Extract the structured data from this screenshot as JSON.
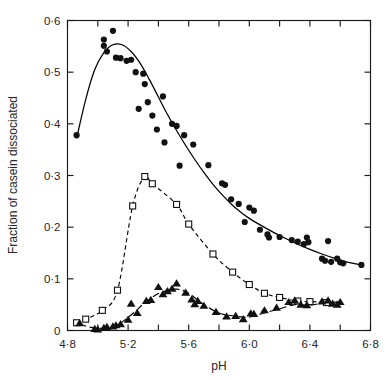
{
  "chart_data": {
    "type": "scatter",
    "title": "",
    "xlabel": "pH",
    "ylabel": "Fraction of casein dissociated",
    "xlim": [
      4.8,
      6.8
    ],
    "ylim": [
      0,
      0.6
    ],
    "grid": false,
    "legend_position": "none",
    "x_ticks": [
      4.8,
      5.2,
      5.6,
      6.0,
      6.4,
      6.8
    ],
    "x_tick_labels": [
      "4·8",
      "5·2",
      "5·6",
      "6·0",
      "6·4",
      "6·8"
    ],
    "x_minor_ticks": [
      5.0,
      5.4,
      5.8,
      6.2,
      6.6
    ],
    "y_ticks": [
      0,
      0.1,
      0.2,
      0.3,
      0.4,
      0.5,
      0.6
    ],
    "y_tick_labels": [
      "0",
      "0·1",
      "0·2",
      "0·3",
      "0·4",
      "0·5",
      "0·6"
    ],
    "series": [
      {
        "name": "total-casein",
        "marker": "filled-circle",
        "line_style": "solid",
        "points": [
          [
            4.86,
            0.378
          ],
          [
            5.04,
            0.563
          ],
          [
            5.04,
            0.551
          ],
          [
            5.06,
            0.54
          ],
          [
            5.1,
            0.58
          ],
          [
            5.12,
            0.528
          ],
          [
            5.15,
            0.527
          ],
          [
            5.19,
            0.522
          ],
          [
            5.22,
            0.524
          ],
          [
            5.25,
            0.5
          ],
          [
            5.27,
            0.429
          ],
          [
            5.3,
            0.497
          ],
          [
            5.31,
            0.477
          ],
          [
            5.33,
            0.442
          ],
          [
            5.36,
            0.416
          ],
          [
            5.39,
            0.389
          ],
          [
            5.43,
            0.453
          ],
          [
            5.44,
            0.364
          ],
          [
            5.49,
            0.4
          ],
          [
            5.52,
            0.396
          ],
          [
            5.54,
            0.319
          ],
          [
            5.57,
            0.378
          ],
          [
            5.63,
            0.36
          ],
          [
            5.73,
            0.32
          ],
          [
            5.82,
            0.285
          ],
          [
            5.84,
            0.282
          ],
          [
            5.88,
            0.254
          ],
          [
            5.93,
            0.245
          ],
          [
            5.97,
            0.21
          ],
          [
            6.0,
            0.238
          ],
          [
            6.03,
            0.232
          ],
          [
            6.07,
            0.195
          ],
          [
            6.12,
            0.186
          ],
          [
            6.13,
            0.18
          ],
          [
            6.2,
            0.181
          ],
          [
            6.28,
            0.175
          ],
          [
            6.32,
            0.172
          ],
          [
            6.36,
            0.167
          ],
          [
            6.38,
            0.18
          ],
          [
            6.39,
            0.171
          ],
          [
            6.48,
            0.139
          ],
          [
            6.5,
            0.135
          ],
          [
            6.52,
            0.173
          ],
          [
            6.54,
            0.133
          ],
          [
            6.58,
            0.139
          ],
          [
            6.6,
            0.132
          ],
          [
            6.62,
            0.13
          ],
          [
            6.74,
            0.127
          ]
        ],
        "fit_curve": [
          [
            4.86,
            0.372
          ],
          [
            4.92,
            0.447
          ],
          [
            4.98,
            0.505
          ],
          [
            5.04,
            0.538
          ],
          [
            5.1,
            0.553
          ],
          [
            5.16,
            0.553
          ],
          [
            5.22,
            0.54
          ],
          [
            5.28,
            0.517
          ],
          [
            5.34,
            0.486
          ],
          [
            5.4,
            0.452
          ],
          [
            5.46,
            0.418
          ],
          [
            5.52,
            0.387
          ],
          [
            5.58,
            0.358
          ],
          [
            5.64,
            0.331
          ],
          [
            5.7,
            0.306
          ],
          [
            5.76,
            0.283
          ],
          [
            5.82,
            0.263
          ],
          [
            5.88,
            0.245
          ],
          [
            5.94,
            0.23
          ],
          [
            6.0,
            0.217
          ],
          [
            6.08,
            0.203
          ],
          [
            6.16,
            0.19
          ],
          [
            6.24,
            0.178
          ],
          [
            6.32,
            0.167
          ],
          [
            6.4,
            0.157
          ],
          [
            6.48,
            0.148
          ],
          [
            6.56,
            0.14
          ],
          [
            6.64,
            0.133
          ],
          [
            6.74,
            0.127
          ]
        ]
      },
      {
        "name": "beta-casein",
        "marker": "open-square",
        "line_style": "dashed",
        "points": [
          [
            4.86,
            0.015
          ],
          [
            4.92,
            0.022
          ],
          [
            5.03,
            0.039
          ],
          [
            5.13,
            0.078
          ],
          [
            5.23,
            0.241
          ],
          [
            5.31,
            0.298
          ],
          [
            5.36,
            0.284
          ],
          [
            5.52,
            0.244
          ],
          [
            5.6,
            0.206
          ],
          [
            5.76,
            0.148
          ],
          [
            5.89,
            0.113
          ],
          [
            6.0,
            0.089
          ],
          [
            6.1,
            0.072
          ],
          [
            6.2,
            0.064
          ],
          [
            6.32,
            0.057
          ],
          [
            6.4,
            0.056
          ],
          [
            6.51,
            0.054
          ]
        ],
        "fit_curve": [
          [
            4.86,
            0.015
          ],
          [
            4.92,
            0.022
          ],
          [
            5.03,
            0.039
          ],
          [
            5.13,
            0.078
          ],
          [
            5.23,
            0.241
          ],
          [
            5.31,
            0.298
          ],
          [
            5.36,
            0.284
          ],
          [
            5.52,
            0.244
          ],
          [
            5.6,
            0.206
          ],
          [
            5.76,
            0.148
          ],
          [
            5.89,
            0.113
          ],
          [
            6.0,
            0.089
          ],
          [
            6.1,
            0.072
          ],
          [
            6.2,
            0.064
          ],
          [
            6.32,
            0.057
          ],
          [
            6.4,
            0.056
          ],
          [
            6.51,
            0.054
          ]
        ]
      },
      {
        "name": "kappa-casein",
        "marker": "filled-triangle",
        "line_style": "dashed-long",
        "points": [
          [
            4.88,
            0.014
          ],
          [
            4.98,
            0.003
          ],
          [
            5.0,
            0.002
          ],
          [
            5.04,
            0.005
          ],
          [
            5.06,
            0.007
          ],
          [
            5.1,
            0.008
          ],
          [
            5.12,
            0.01
          ],
          [
            5.15,
            0.012
          ],
          [
            5.2,
            0.021
          ],
          [
            5.22,
            0.052
          ],
          [
            5.26,
            0.034
          ],
          [
            5.32,
            0.057
          ],
          [
            5.35,
            0.059
          ],
          [
            5.4,
            0.084
          ],
          [
            5.43,
            0.07
          ],
          [
            5.46,
            0.076
          ],
          [
            5.49,
            0.081
          ],
          [
            5.52,
            0.091
          ],
          [
            5.58,
            0.073
          ],
          [
            5.62,
            0.06
          ],
          [
            5.64,
            0.051
          ],
          [
            5.66,
            0.057
          ],
          [
            5.7,
            0.048
          ],
          [
            5.78,
            0.036
          ],
          [
            5.85,
            0.027
          ],
          [
            5.91,
            0.028
          ],
          [
            5.96,
            0.022
          ],
          [
            6.01,
            0.033
          ],
          [
            6.03,
            0.032
          ],
          [
            6.1,
            0.039
          ],
          [
            6.18,
            0.044
          ],
          [
            6.26,
            0.055
          ],
          [
            6.3,
            0.058
          ],
          [
            6.34,
            0.05
          ],
          [
            6.38,
            0.049
          ],
          [
            6.48,
            0.056
          ],
          [
            6.52,
            0.058
          ],
          [
            6.55,
            0.052
          ],
          [
            6.58,
            0.05
          ],
          [
            6.6,
            0.055
          ]
        ],
        "fit_curve": [
          [
            4.88,
            0.012
          ],
          [
            5.0,
            0.004
          ],
          [
            5.12,
            0.01
          ],
          [
            5.22,
            0.03
          ],
          [
            5.32,
            0.056
          ],
          [
            5.42,
            0.074
          ],
          [
            5.52,
            0.08
          ],
          [
            5.6,
            0.072
          ],
          [
            5.7,
            0.05
          ],
          [
            5.8,
            0.034
          ],
          [
            5.9,
            0.028
          ],
          [
            6.0,
            0.026
          ],
          [
            6.1,
            0.034
          ],
          [
            6.2,
            0.042
          ],
          [
            6.3,
            0.05
          ],
          [
            6.4,
            0.049
          ],
          [
            6.5,
            0.054
          ],
          [
            6.6,
            0.055
          ]
        ]
      }
    ]
  }
}
